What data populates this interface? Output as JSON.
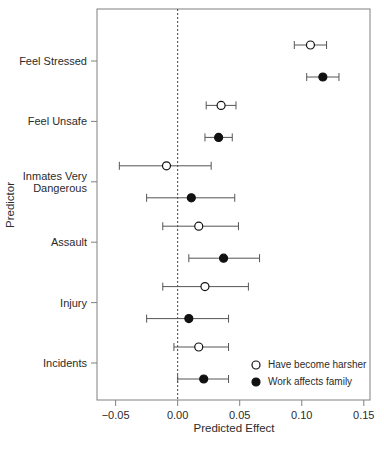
{
  "chart_data": {
    "type": "scatter",
    "title": "",
    "xlabel": "Predicted Effect",
    "ylabel": "Predictor",
    "xlim": [
      -0.065,
      0.155
    ],
    "xticks": [
      -0.05,
      0.0,
      0.05,
      0.1,
      0.15
    ],
    "xticklabels": [
      "−0.05",
      "0.00",
      "0.05",
      "0.10",
      "0.15"
    ],
    "categories": [
      "Feel Stressed",
      "Feel Unsafe",
      "Inmates Very Dangerous",
      "Assault",
      "Injury",
      "Incidents"
    ],
    "category_labels": [
      [
        "Feel Stressed"
      ],
      [
        "Feel Unsafe"
      ],
      [
        "Inmates Very",
        "Dangerous"
      ],
      [
        "Assault"
      ],
      [
        "Injury"
      ],
      [
        "Incidents"
      ]
    ],
    "grid": false,
    "reference_line": 0.0,
    "legend_position": "bottom-right",
    "series": [
      {
        "name": "Have become harsher",
        "marker": "open-circle",
        "estimates": [
          0.107,
          0.035,
          -0.009,
          0.017,
          0.022,
          0.017
        ],
        "ci_low": [
          0.094,
          0.023,
          -0.047,
          -0.012,
          -0.012,
          -0.003
        ],
        "ci_high": [
          0.12,
          0.047,
          0.027,
          0.049,
          0.057,
          0.041
        ]
      },
      {
        "name": "Work affects family",
        "marker": "filled-circle",
        "estimates": [
          0.117,
          0.033,
          0.011,
          0.037,
          0.009,
          0.021
        ],
        "ci_low": [
          0.104,
          0.022,
          -0.025,
          0.009,
          -0.025,
          0.0
        ],
        "ci_high": [
          0.13,
          0.044,
          0.046,
          0.066,
          0.041,
          0.041
        ]
      }
    ]
  },
  "legend": {
    "entries": [
      {
        "label": "Have become harsher",
        "marker": "open-circle"
      },
      {
        "label": "Work affects family",
        "marker": "filled-circle"
      }
    ]
  },
  "axes": {
    "x_title": "Predicted Effect",
    "y_title": "Predictor"
  }
}
